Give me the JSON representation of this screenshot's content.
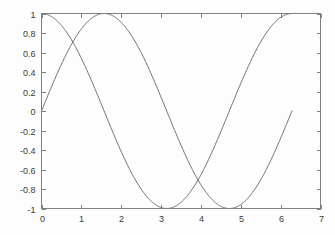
{
  "chart_data": {
    "type": "line",
    "title": "",
    "xlabel": "",
    "ylabel": "",
    "xlim": [
      0,
      7
    ],
    "ylim": [
      -1,
      1
    ],
    "grid": false,
    "legend": "none",
    "background": "#fdfdfd",
    "line_color": "#6e6e72",
    "axis_color": "#808080",
    "x_ticks": [
      0,
      1,
      2,
      3,
      4,
      5,
      6,
      7
    ],
    "x_tick_labels": [
      "0",
      "1",
      "2",
      "3",
      "4",
      "5",
      "6",
      "7"
    ],
    "y_ticks": [
      -1,
      -0.8,
      -0.6,
      -0.4,
      -0.2,
      0,
      0.2,
      0.4,
      0.6,
      0.8,
      1
    ],
    "y_tick_labels": [
      "-1",
      "-0.8",
      "-0.6",
      "-0.4",
      "-0.2",
      "0",
      "0.2",
      "0.4",
      "0.6",
      "0.8",
      "1"
    ],
    "x_domain": [
      0,
      6.2832
    ],
    "series": [
      {
        "name": "cos",
        "function": "cos(x)",
        "x": [
          0,
          0.3142,
          0.6283,
          0.9425,
          1.2566,
          1.5708,
          1.885,
          2.1991,
          2.5133,
          2.8274,
          3.1416,
          3.4558,
          3.7699,
          4.0841,
          4.3982,
          4.7124,
          5.0265,
          5.3407,
          5.6549,
          5.969,
          6.2832
        ],
        "values": [
          1,
          0.951,
          0.809,
          0.588,
          0.309,
          0,
          -0.309,
          -0.588,
          -0.809,
          -0.951,
          -1,
          -0.951,
          -0.809,
          -0.588,
          -0.309,
          0,
          0.309,
          0.588,
          0.809,
          0.951,
          1
        ]
      },
      {
        "name": "sin",
        "function": "sin(x)",
        "x": [
          0,
          0.3142,
          0.6283,
          0.9425,
          1.2566,
          1.5708,
          1.885,
          2.1991,
          2.5133,
          2.8274,
          3.1416,
          3.4558,
          3.7699,
          4.0841,
          4.3982,
          4.7124,
          5.0265,
          5.3407,
          5.6549,
          5.969,
          6.2832
        ],
        "values": [
          0,
          0.309,
          0.588,
          0.809,
          0.951,
          1,
          0.951,
          0.809,
          0.588,
          0.309,
          0,
          -0.309,
          -0.588,
          -0.809,
          -0.951,
          -1,
          -0.951,
          -0.809,
          -0.588,
          -0.309,
          0
        ]
      }
    ],
    "annotations": []
  }
}
